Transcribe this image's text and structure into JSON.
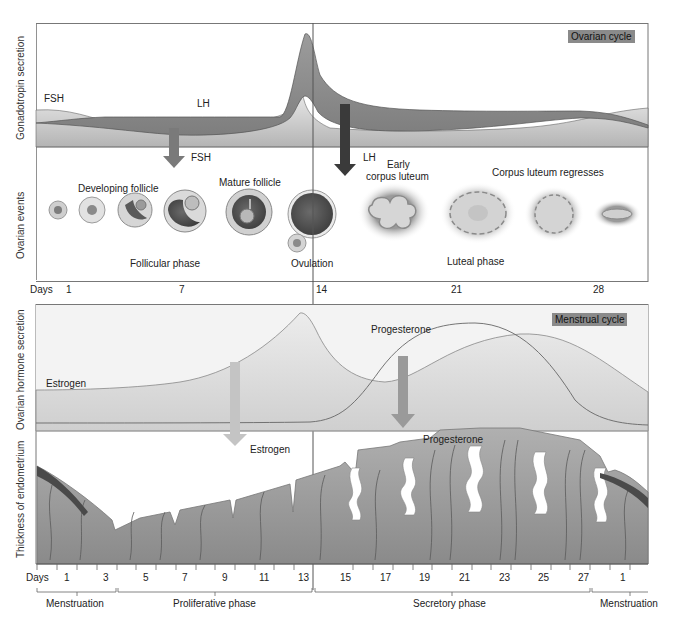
{
  "ovarian_panel": {
    "badge": "Ovarian cycle",
    "y_label_top": "Gonadotropin secretion",
    "y_label_bottom": "Ovarian events",
    "hormones": {
      "fsh": "FSH",
      "lh": "LH"
    },
    "arrows": {
      "fsh_arrow": "FSH",
      "lh_arrow": "LH"
    },
    "event_labels": {
      "developing_follicle": "Developing follicle",
      "mature_follicle": "Mature follicle",
      "early_corpus_luteum_line1": "Early",
      "early_corpus_luteum_line2": "corpus luteum",
      "corpus_luteum_regresses": "Corpus luteum regresses",
      "follicular_phase": "Follicular phase",
      "ovulation": "Ovulation",
      "luteal_phase": "Luteal phase"
    },
    "days_label": "Days",
    "days": [
      "1",
      "7",
      "14",
      "21",
      "28"
    ]
  },
  "menstrual_panel": {
    "badge": "Menstrual cycle",
    "y_label_top": "Ovarian hormone secretion",
    "y_label_bottom": "Thickness of endometrium",
    "hormones": {
      "estrogen": "Estrogen",
      "progesterone": "Progesterone"
    },
    "arrows": {
      "estrogen_arrow": "Estrogen",
      "progesterone_arrow": "Progesterone"
    },
    "days_label": "Days",
    "days": [
      "1",
      "3",
      "5",
      "7",
      "9",
      "11",
      "13",
      "15",
      "17",
      "19",
      "21",
      "23",
      "25",
      "27",
      "1"
    ],
    "phases": [
      "Menstruation",
      "Proliferative phase",
      "Secretory phase",
      "Menstruation"
    ]
  },
  "colors": {
    "fsh_fill": "#c8c8c8",
    "lh_fill": "#8e8e8e",
    "estrogen_fill": "#d9d9d9",
    "endometrium": "#9a9a9a",
    "badge": "#8a8a8a",
    "axis": "#555555"
  }
}
